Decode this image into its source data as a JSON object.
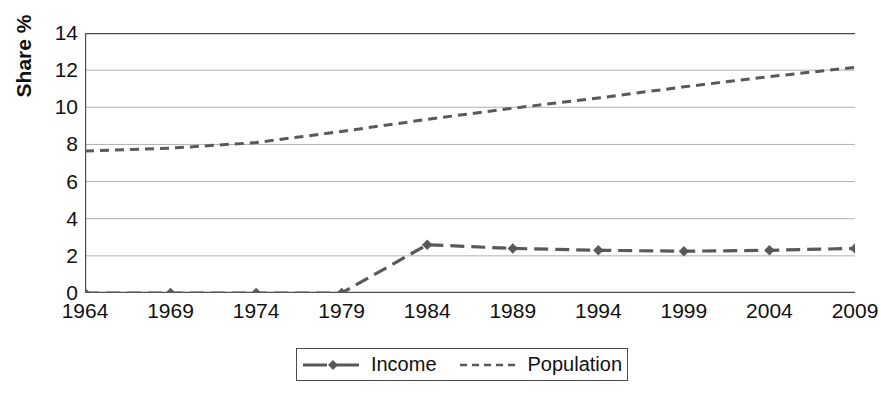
{
  "chart_data": {
    "type": "line",
    "title": "",
    "xlabel": "",
    "ylabel": "Share %",
    "categories": [
      "1964",
      "1969",
      "1974",
      "1979",
      "1984",
      "1989",
      "1994",
      "1999",
      "2004",
      "2009"
    ],
    "x": [
      1964,
      1969,
      1974,
      1979,
      1984,
      1989,
      1994,
      1999,
      2004,
      2009
    ],
    "ylim": [
      0,
      14
    ],
    "yticks": [
      0,
      2,
      4,
      6,
      8,
      10,
      12,
      14
    ],
    "ytick_labels": [
      "0",
      "2",
      "4",
      "6",
      "8",
      "10",
      "12",
      "14"
    ],
    "grid": true,
    "grid_axis": "y",
    "legend_position": "bottom-center",
    "series": [
      {
        "name": "Income",
        "style": "dashed-with-diamond-markers",
        "color": "#595959",
        "values": [
          0.0,
          0.0,
          0.0,
          0.0,
          2.6,
          2.4,
          2.3,
          2.25,
          2.3,
          2.4
        ]
      },
      {
        "name": "Population",
        "style": "dotted-dashed",
        "color": "#595959",
        "values": [
          7.65,
          7.8,
          8.1,
          8.7,
          9.35,
          9.95,
          10.5,
          11.1,
          11.65,
          12.15
        ]
      }
    ]
  },
  "axis": {
    "y_title": "Share %"
  },
  "legend": {
    "items": [
      {
        "label": "Income",
        "icon": "line-with-diamond-marker-icon"
      },
      {
        "label": "Population",
        "icon": "dashed-line-icon"
      }
    ]
  },
  "colors": {
    "series": "#595959",
    "axis": "#4d4d4d",
    "gridline": "#b0b0b0",
    "text": "#111111",
    "background": "#ffffff"
  }
}
